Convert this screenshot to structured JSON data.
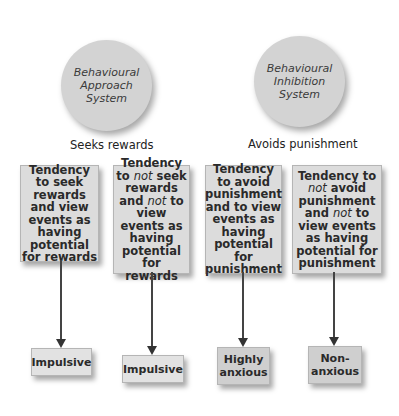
{
  "systems": [
    {
      "name": "Behavioural\nApproach\nSystem",
      "label": "Seeks rewards"
    },
    {
      "name": "Behavioural\nInhibition\nSystem",
      "label": "Avoids punishment"
    }
  ],
  "tendencies": [
    {
      "parts": [
        "Tendency to seek rewards and view events as having potential for rewards"
      ]
    },
    {
      "parts": [
        "Tendency to ",
        "not",
        " seek rewards and ",
        "not",
        " to view events as having potential for rewards"
      ]
    },
    {
      "parts": [
        "Tendency to avoid punishment and to view events as having potential for punishment"
      ]
    },
    {
      "parts": [
        "Tendency to ",
        "not",
        " avoid punishment and ",
        "not",
        " to view events as having potential for punishment"
      ]
    }
  ],
  "outcomes": [
    {
      "label": "Impulsive"
    },
    {
      "label": "Impulsive"
    },
    {
      "label": "Highly\nanxious"
    },
    {
      "label": "Non-\nanxious"
    }
  ]
}
